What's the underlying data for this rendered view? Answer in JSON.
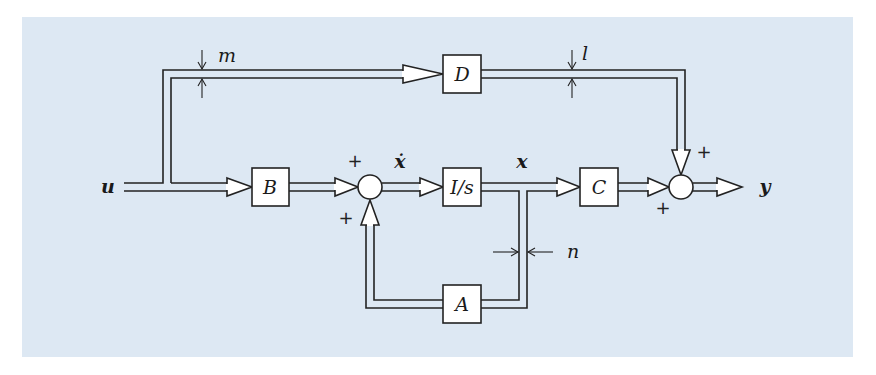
{
  "diagram": {
    "type": "block-diagram",
    "title": "",
    "background_color": "#dde8f3",
    "line_color": "#222222",
    "signals": {
      "input": "u",
      "state_derivative": "ẋ",
      "state": "x",
      "output": "y"
    },
    "blocks": [
      {
        "id": "B",
        "label": "B"
      },
      {
        "id": "I_s",
        "label": "I/s"
      },
      {
        "id": "C",
        "label": "C"
      },
      {
        "id": "D",
        "label": "D"
      },
      {
        "id": "A",
        "label": "A"
      }
    ],
    "summing_junctions": [
      {
        "id": "sum1",
        "signs": [
          "+",
          "+"
        ]
      },
      {
        "id": "sum2",
        "signs": [
          "+",
          "+"
        ]
      }
    ],
    "dimension_labels": {
      "m": "m",
      "l": "l",
      "n": "n"
    },
    "edges": [
      {
        "from": "u",
        "to": "B"
      },
      {
        "from": "u",
        "to": "D",
        "note": "width m"
      },
      {
        "from": "B",
        "to": "sum1",
        "sign": "+"
      },
      {
        "from": "A",
        "to": "sum1",
        "sign": "+"
      },
      {
        "from": "sum1",
        "to": "I_s",
        "signal": "ẋ"
      },
      {
        "from": "I_s",
        "to": "C",
        "signal": "x"
      },
      {
        "from": "I_s",
        "to": "A",
        "note": "width n"
      },
      {
        "from": "C",
        "to": "sum2",
        "sign": "+"
      },
      {
        "from": "D",
        "to": "sum2",
        "sign": "+",
        "note": "width l"
      },
      {
        "from": "sum2",
        "to": "y"
      }
    ]
  }
}
